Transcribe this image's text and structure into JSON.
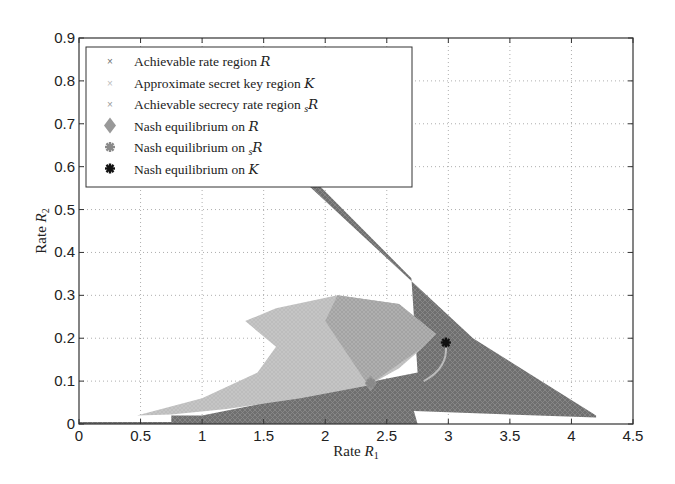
{
  "chart_data": {
    "type": "scatter",
    "title": "",
    "xlabel": "Rate R1",
    "ylabel": "Rate R2",
    "xlim": [
      0,
      4.5
    ],
    "ylim": [
      0,
      0.9
    ],
    "xticks": [
      "0",
      "0.5",
      "1",
      "1.5",
      "2",
      "2.5",
      "3",
      "3.5",
      "4",
      "4.5"
    ],
    "yticks": [
      "0",
      "0.1",
      "0.2",
      "0.3",
      "0.4",
      "0.5",
      "0.6",
      "0.7",
      "0.8",
      "0.9"
    ],
    "grid": true,
    "legend_position": "upper left",
    "legend": [
      "Achievable rate region R",
      "Approximate secret key region K",
      "Achievable secrecy rate region sR",
      "Nash equilibrium on R",
      "Nash equilibrium on sR",
      "Nash equilibrium on K"
    ],
    "series": [
      {
        "name": "Achievable rate region R",
        "marker": "x",
        "color": "#6e6e6e",
        "outline": [
          [
            0,
            0
          ],
          [
            2.75,
            0
          ],
          [
            2.72,
            0.03
          ],
          [
            4.2,
            0.015
          ],
          [
            4.2,
            0.02
          ],
          [
            3.2,
            0.2
          ],
          [
            1.7,
            0.6
          ],
          [
            1.8,
            0.6
          ],
          [
            2.7,
            0.34
          ],
          [
            2.75,
            0.12
          ],
          [
            1.0,
            0.02
          ],
          [
            0.75,
            0.02
          ],
          [
            0.75,
            0.005
          ],
          [
            0,
            0.005
          ]
        ]
      },
      {
        "name": "Approximate secret key region K",
        "marker": "x",
        "color": "#bdbdbd",
        "outline": [
          [
            0.47,
            0.02
          ],
          [
            1.0,
            0.06
          ],
          [
            1.45,
            0.12
          ],
          [
            1.6,
            0.18
          ],
          [
            1.35,
            0.24
          ],
          [
            1.6,
            0.27
          ],
          [
            2.1,
            0.3
          ],
          [
            2.6,
            0.28
          ],
          [
            2.9,
            0.21
          ],
          [
            2.8,
            0.18
          ],
          [
            2.6,
            0.13
          ],
          [
            2.35,
            0.09
          ],
          [
            1.8,
            0.06
          ],
          [
            1.2,
            0.035
          ],
          [
            0.75,
            0.022
          ]
        ]
      },
      {
        "name": "Achievable secrecy rate region sR",
        "marker": "x",
        "color": "#9a9a9a",
        "outline": [
          [
            2.0,
            0.24
          ],
          [
            2.1,
            0.3
          ],
          [
            2.6,
            0.28
          ],
          [
            2.9,
            0.21
          ],
          [
            2.8,
            0.18
          ],
          [
            2.55,
            0.13
          ],
          [
            2.35,
            0.09
          ]
        ]
      },
      {
        "name": "Nash equilibrium on R",
        "marker": "diamond",
        "color": "#999999",
        "points": [
          [
            2.37,
            0.095
          ]
        ]
      },
      {
        "name": "Nash equilibrium on sR",
        "marker": "star",
        "color": "#8a8a8a",
        "points": [
          [
            2.37,
            0.095
          ]
        ]
      },
      {
        "name": "Nash equilibrium on K",
        "marker": "star",
        "color": "#111111",
        "points": [
          [
            2.98,
            0.19
          ]
        ]
      }
    ]
  }
}
